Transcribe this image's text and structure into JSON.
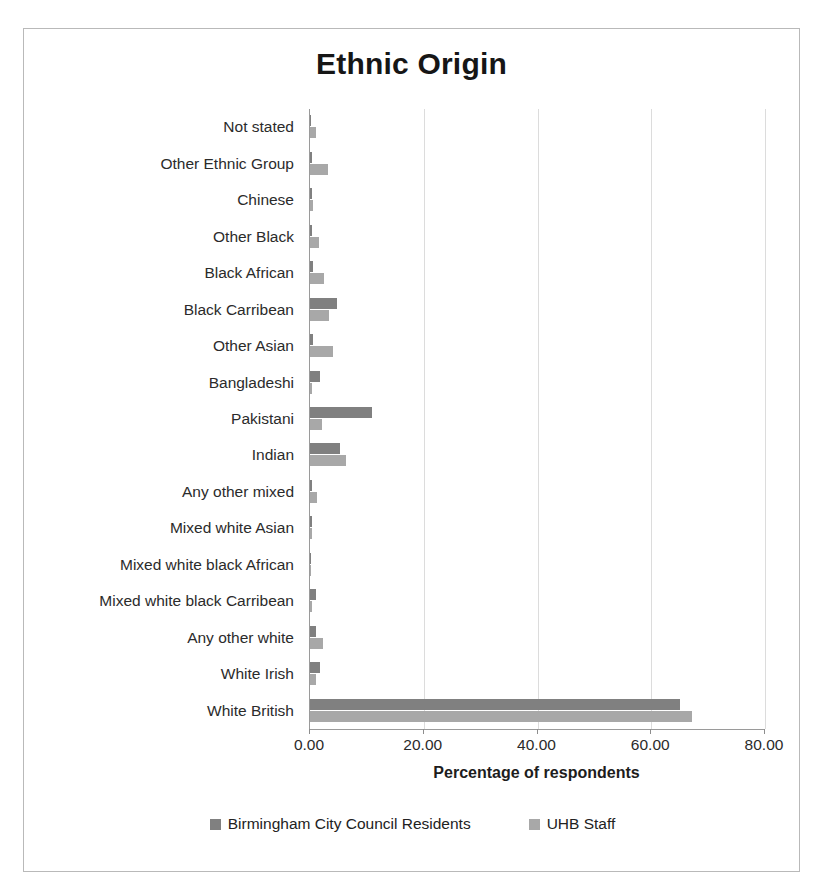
{
  "chart_data": {
    "type": "bar",
    "orientation": "horizontal",
    "title": "Ethnic Origin",
    "xlabel": "Percentage of respondents",
    "ylabel": "",
    "xlim": [
      0,
      80
    ],
    "xticks": [
      "0.00",
      "20.00",
      "40.00",
      "60.00",
      "80.00"
    ],
    "xtick_values": [
      0,
      20,
      40,
      60,
      80
    ],
    "grid": true,
    "legend_position": "bottom",
    "categories": [
      "Not stated",
      "Other Ethnic Group",
      "Chinese",
      "Other Black",
      "Black African",
      "Black Carribean",
      "Other Asian",
      "Bangladeshi",
      "Pakistani",
      "Indian",
      "Any other mixed",
      "Mixed white Asian",
      "Mixed white black African",
      "Mixed white black Carribean",
      "Any other white",
      "White Irish",
      "White British"
    ],
    "series": [
      {
        "name": "Birmingham City Council Residents",
        "color": "#808080",
        "values": [
          0.0,
          0.4,
          0.4,
          0.4,
          0.5,
          4.7,
          0.5,
          1.8,
          10.9,
          5.2,
          0.3,
          0.3,
          0.2,
          1.0,
          1.1,
          1.8,
          65.0
        ]
      },
      {
        "name": "UHB Staff",
        "color": "#a8a8a8",
        "values": [
          1.1,
          3.2,
          0.6,
          1.6,
          2.4,
          3.4,
          4.0,
          0.4,
          2.1,
          6.4,
          1.2,
          0.3,
          0.1,
          0.3,
          2.3,
          1.0,
          67.2
        ]
      }
    ]
  },
  "legend": [
    {
      "label": "Birmingham City Council Residents",
      "color": "#808080"
    },
    {
      "label": "UHB Staff",
      "color": "#a8a8a8"
    }
  ]
}
